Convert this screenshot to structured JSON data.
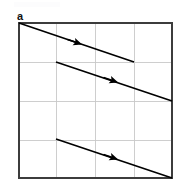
{
  "figure": {
    "panel_label": "a",
    "background_color": "#ffffff"
  },
  "chart_data": {
    "type": "line",
    "title": "a",
    "xlabel": "",
    "ylabel": "",
    "xlim": [
      0,
      4
    ],
    "ylim": [
      0,
      4
    ],
    "grid": true,
    "grid_color": "#c8c8c8",
    "axis_color": "#3c3c3c",
    "line_color": "#000000",
    "legend": "none",
    "x_tick_labels": [],
    "y_tick_labels": [],
    "x_gridlines": [
      1,
      2,
      3
    ],
    "y_gridlines": [
      1,
      2,
      3
    ],
    "arrow_style": "mid-segment filled triangle",
    "series": [
      {
        "name": "trajectory-1",
        "x": [
          0,
          3
        ],
        "y": [
          4,
          3
        ],
        "arrow_at_x": 1.45,
        "arrow_at_y": 3.52
      },
      {
        "name": "trajectory-2",
        "x": [
          1,
          4
        ],
        "y": [
          3,
          2
        ],
        "arrow_at_x": 2.45,
        "arrow_at_y": 2.52
      },
      {
        "name": "trajectory-3",
        "x": [
          1,
          4
        ],
        "y": [
          1,
          0
        ],
        "arrow_at_x": 2.45,
        "arrow_at_y": 0.52
      }
    ]
  },
  "geometry": {
    "frame": {
      "x0": 19,
      "y0": 23,
      "x1": 172,
      "y1": 178
    },
    "vertical_gridlines_px": [
      56,
      95,
      134
    ],
    "horizontal_gridlines_px": [
      62,
      101,
      140
    ],
    "lines_px": [
      {
        "x1": 19,
        "y1": 23,
        "x2": 134,
        "y2": 62
      },
      {
        "x1": 56,
        "y1": 62,
        "x2": 172,
        "y2": 101
      },
      {
        "x1": 56,
        "y1": 139,
        "x2": 172,
        "y2": 178
      }
    ],
    "arrowheads_px": [
      {
        "cx": 78,
        "cy": 43,
        "angle_deg": 18.7
      },
      {
        "cx": 114,
        "cy": 81,
        "angle_deg": 18.7
      },
      {
        "cx": 114,
        "cy": 158,
        "angle_deg": 18.7
      }
    ]
  }
}
